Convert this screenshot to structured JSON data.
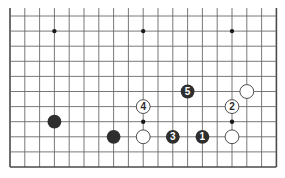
{
  "board": {
    "columns": 19,
    "rows_visible": 11,
    "edges": {
      "left": true,
      "right": true,
      "bottom": true,
      "top": false
    },
    "colors": {
      "line": "#6a6a6a",
      "edge": "#4a4a4a",
      "black_stone": "#2e2e2e",
      "white_stone": "#ffffff",
      "hoshi": "#1a1a1a"
    },
    "star_points": [
      {
        "col": 3,
        "row": 1
      },
      {
        "col": 9,
        "row": 1
      },
      {
        "col": 15,
        "row": 1
      },
      {
        "col": 3,
        "row": 7
      },
      {
        "col": 9,
        "row": 7
      },
      {
        "col": 15,
        "row": 7
      }
    ],
    "stones": [
      {
        "color": "black",
        "col": 3,
        "row": 7,
        "label": ""
      },
      {
        "color": "black",
        "col": 7,
        "row": 8,
        "label": ""
      },
      {
        "color": "white",
        "col": 9,
        "row": 8,
        "label": ""
      },
      {
        "color": "white",
        "col": 15,
        "row": 8,
        "label": ""
      },
      {
        "color": "white",
        "col": 16,
        "row": 5,
        "label": ""
      },
      {
        "color": "black",
        "col": 13,
        "row": 8,
        "label": "1"
      },
      {
        "color": "white",
        "col": 15,
        "row": 6,
        "label": "2"
      },
      {
        "color": "black",
        "col": 11,
        "row": 8,
        "label": "3"
      },
      {
        "color": "white",
        "col": 9,
        "row": 6,
        "label": "4"
      },
      {
        "color": "black",
        "col": 12,
        "row": 5,
        "label": "5"
      }
    ]
  }
}
